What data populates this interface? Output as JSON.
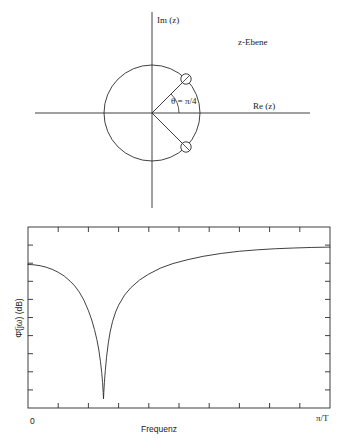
{
  "figure": {
    "zplane": {
      "title": "z-Ebene",
      "imag_axis_label": "Im (z)",
      "real_axis_label": "Re (z)",
      "angle_label": "θ = π/4",
      "zero_marker_icon": "zero-circle-icon",
      "zeros": [
        {
          "angle_deg": 45,
          "radius": 1.0
        },
        {
          "angle_deg": -45,
          "radius": 1.0
        }
      ],
      "unit_circle_radius": 1.0
    },
    "magnitude_plot": {
      "ylabel": "Φ̄(jω) (dB)",
      "xlabel": "Frequenz",
      "x_tick_start_label": "0",
      "x_tick_end_label": "π/T",
      "x_ticks_count": 9,
      "y_ticks_count": 9
    },
    "caption": ""
  },
  "chart_data": [
    {
      "type": "scatter",
      "title": "z-Ebene",
      "xlabel": "Re (z)",
      "ylabel": "Im (z)",
      "xlim": [
        -1.6,
        1.6
      ],
      "ylim": [
        -1.6,
        1.6
      ],
      "grid": false,
      "annotations": [
        "θ = π/4",
        "z-Ebene"
      ],
      "series": [
        {
          "name": "Nullstellen",
          "marker": "open-circle",
          "x": [
            0.7071,
            0.7071
          ],
          "y": [
            0.7071,
            -0.7071
          ]
        }
      ],
      "unit_circle": {
        "center": [
          0,
          0
        ],
        "radius": 1.0
      }
    },
    {
      "type": "line",
      "title": "",
      "xlabel": "Frequenz",
      "ylabel": "Φ̄(jω) (dB)",
      "xlim": [
        0,
        1
      ],
      "xtick_labels": [
        "0",
        "π/T"
      ],
      "ylim": [
        0,
        1
      ],
      "grid": false,
      "legend": null,
      "series": [
        {
          "name": "Kerbfilter-Amplitudengang",
          "x": [
            0.0,
            0.02,
            0.04,
            0.06,
            0.08,
            0.1,
            0.12,
            0.14,
            0.155,
            0.17,
            0.185,
            0.2,
            0.21,
            0.22,
            0.228,
            0.234,
            0.24,
            0.244,
            0.247,
            0.249,
            0.25,
            0.251,
            0.253,
            0.256,
            0.26,
            0.266,
            0.272,
            0.28,
            0.29,
            0.3,
            0.32,
            0.34,
            0.37,
            0.4,
            0.44,
            0.48,
            0.53,
            0.58,
            0.64,
            0.7,
            0.76,
            0.82,
            0.88,
            0.94,
            1.0
          ],
          "y": [
            0.793,
            0.791,
            0.786,
            0.778,
            0.766,
            0.75,
            0.729,
            0.7,
            0.674,
            0.64,
            0.596,
            0.538,
            0.492,
            0.434,
            0.378,
            0.326,
            0.256,
            0.196,
            0.14,
            0.085,
            0.05,
            0.086,
            0.142,
            0.206,
            0.28,
            0.36,
            0.42,
            0.478,
            0.53,
            0.568,
            0.624,
            0.664,
            0.708,
            0.74,
            0.774,
            0.798,
            0.82,
            0.838,
            0.854,
            0.866,
            0.874,
            0.88,
            0.884,
            0.887,
            0.889
          ]
        }
      ]
    }
  ]
}
